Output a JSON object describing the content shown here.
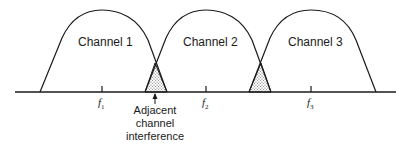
{
  "diagram": {
    "channels": [
      {
        "label": "Channel 1",
        "center": "f",
        "sub": "1"
      },
      {
        "label": "Channel 2",
        "center": "f",
        "sub": "2"
      },
      {
        "label": "Channel 3",
        "center": "f",
        "sub": "3"
      }
    ],
    "annotation": {
      "line1": "Adjacent",
      "line2": "channel",
      "line3": "interference"
    },
    "colors": {
      "stroke": "#1a1a1a",
      "background": "#ffffff",
      "overlap_fill": "#c8c8c8"
    }
  }
}
